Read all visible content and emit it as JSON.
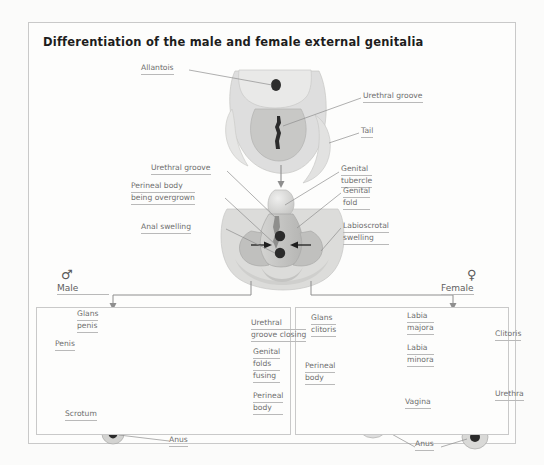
{
  "figure": {
    "title": "Differentiation of the male and female external genitalia",
    "background_color": "#fbfbfa",
    "label_color": "#6e6e6e",
    "frame_color": "#c9c9c9"
  },
  "stage_indifferent": {
    "name": "indifferent-stage",
    "labels": {
      "allantois": "Allantois",
      "urethral_groove": "Urethral groove",
      "tail": "Tail"
    }
  },
  "stage_intermediate": {
    "name": "intermediate-stage",
    "labels": {
      "urethral_groove": "Urethral groove",
      "perineal_body_l1": "Perineal body",
      "perineal_body_l2": "being overgrown",
      "anal_swelling": "Anal swelling",
      "genital_tubercle_l1": "Genital",
      "genital_tubercle_l2": "tubercle",
      "genital_fold_l1": "Genital",
      "genital_fold_l2": "fold",
      "labioscrotal_l1": "Labioscrotal",
      "labioscrotal_l2": "swelling"
    }
  },
  "male": {
    "symbol": "♂",
    "heading": "Male",
    "mature": {
      "glans_penis_l1": "Glans",
      "glans_penis_l2": "penis",
      "penis": "Penis",
      "scrotum": "Scrotum",
      "anus": "Anus"
    },
    "developing": {
      "urethral_groove_l1": "Urethral",
      "urethral_groove_l2": "groove closing",
      "genital_folds_l1": "Genital",
      "genital_folds_l2": "folds",
      "genital_folds_l3": "fusing",
      "perineal_body_l1": "Perineal",
      "perineal_body_l2": "body"
    }
  },
  "female": {
    "symbol": "♀",
    "heading": "Female",
    "developing": {
      "glans_clitoris_l1": "Glans",
      "glans_clitoris_l2": "clitoris",
      "perineal_body_l1": "Perineal",
      "perineal_body_l2": "body",
      "anus": "Anus"
    },
    "mature": {
      "labia_majora_l1": "Labia",
      "labia_majora_l2": "majora",
      "labia_minora_l1": "Labia",
      "labia_minora_l2": "minora",
      "vagina": "Vagina",
      "clitoris": "Clitoris",
      "urethra": "Urethra",
      "anus": "Anus"
    }
  }
}
